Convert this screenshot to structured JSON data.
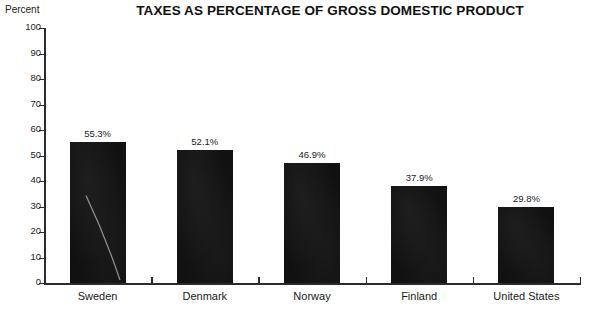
{
  "chart_data": {
    "type": "bar",
    "title": "TAXES AS PERCENTAGE OF GROSS DOMESTIC PRODUCT",
    "xlabel": "",
    "ylabel": "Percent",
    "ylim": [
      0,
      100
    ],
    "yticks": [
      0,
      10,
      20,
      30,
      40,
      50,
      60,
      70,
      80,
      90,
      100
    ],
    "grid": false,
    "legend": "none",
    "categories": [
      "Sweden",
      "Denmark",
      "Norway",
      "Finland",
      "United States"
    ],
    "values": [
      55.3,
      52.1,
      46.9,
      37.9,
      29.8
    ],
    "value_labels": [
      "55.3%",
      "52.1%",
      "46.9%",
      "37.9%",
      "29.8%"
    ],
    "bar_color": "#111111",
    "axis_color": "#2b2b2b",
    "background_color": "#ffffff"
  },
  "axis": {
    "y_label": "Percent",
    "tick_labels": [
      "100",
      "90",
      "80",
      "70",
      "60",
      "50",
      "40",
      "30",
      "20",
      "10",
      "0"
    ]
  }
}
